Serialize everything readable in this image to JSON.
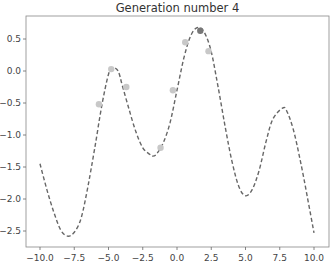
{
  "chart_data": {
    "type": "line",
    "title": "Generation number 4",
    "xlabel": "",
    "ylabel": "",
    "xlim": [
      -11,
      11
    ],
    "ylim": [
      -2.75,
      0.85
    ],
    "grid": false,
    "x_ticks": [
      -10.0,
      -7.5,
      -5.0,
      -2.5,
      0.0,
      2.5,
      5.0,
      7.5,
      10.0
    ],
    "x_tick_labels": [
      "−10.0",
      "−7.5",
      "−5.0",
      "−2.5",
      "0.0",
      "2.5",
      "5.0",
      "7.5",
      "10.0"
    ],
    "y_ticks": [
      0.5,
      0.0,
      -0.5,
      -1.0,
      -1.5,
      -2.0,
      -2.5
    ],
    "y_tick_labels": [
      "0.5",
      "0.0",
      "−0.5",
      "−1.0",
      "−1.5",
      "−2.0",
      "−2.5"
    ],
    "series": [
      {
        "name": "objective function",
        "style": "dashed",
        "color": "#666666",
        "x": [
          -10,
          -9.5,
          -9,
          -8.5,
          -8,
          -7.5,
          -7,
          -6.5,
          -6,
          -5.5,
          -5,
          -4.7,
          -4.3,
          -4,
          -3.5,
          -3,
          -2.5,
          -2,
          -1.8,
          -1.5,
          -1,
          -0.5,
          0,
          0.5,
          1,
          1.5,
          2,
          2.5,
          3,
          3.5,
          4,
          4.5,
          5,
          5.5,
          6,
          6.5,
          7,
          7.7,
          8,
          8.5,
          9,
          9.5,
          10
        ],
        "y": [
          -1.45,
          -1.85,
          -2.2,
          -2.48,
          -2.58,
          -2.52,
          -2.3,
          -1.8,
          -1.2,
          -0.55,
          -0.05,
          0.05,
          0.0,
          -0.22,
          -0.6,
          -0.95,
          -1.2,
          -1.3,
          -1.33,
          -1.3,
          -1.12,
          -0.8,
          -0.3,
          0.2,
          0.55,
          0.68,
          0.6,
          0.3,
          -0.25,
          -0.85,
          -1.4,
          -1.8,
          -1.95,
          -1.85,
          -1.55,
          -1.1,
          -0.75,
          -0.58,
          -0.62,
          -0.92,
          -1.4,
          -1.95,
          -2.53
        ]
      },
      {
        "name": "population",
        "style": "scatter",
        "color": "#c8c8c8",
        "x": [
          -5.7,
          -4.8,
          -3.7,
          -1.2,
          -0.3,
          0.6,
          2.3
        ],
        "y": [
          -0.52,
          0.03,
          -0.25,
          -1.2,
          -0.3,
          0.45,
          0.31
        ]
      },
      {
        "name": "best individual",
        "style": "scatter",
        "color": "#777777",
        "x": [
          1.7
        ],
        "y": [
          0.63
        ]
      }
    ]
  }
}
